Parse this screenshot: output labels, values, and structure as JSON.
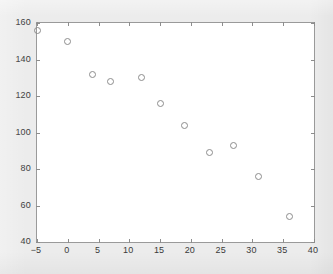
{
  "chart_data": {
    "type": "scatter",
    "title": "",
    "xlabel": "",
    "ylabel": "",
    "xlim": [
      -5,
      40
    ],
    "ylim": [
      40,
      160
    ],
    "xticks": [
      -5,
      0,
      5,
      10,
      15,
      20,
      25,
      30,
      35,
      40
    ],
    "yticks": [
      40,
      60,
      80,
      100,
      120,
      140,
      160
    ],
    "xticklabels": [
      "−5",
      "0",
      "5",
      "10",
      "15",
      "20",
      "25",
      "30",
      "35",
      "40"
    ],
    "yticklabels": [
      "40",
      "60",
      "80",
      "100",
      "120",
      "140",
      "160"
    ],
    "grid": false,
    "legend": null,
    "marker": {
      "shape": "circle-open",
      "edge_color": "#8d8d8d",
      "fill": "none",
      "size_px": 7
    },
    "series": [
      {
        "name": "series-1",
        "x": [
          -5,
          0,
          4,
          7,
          12,
          15,
          19,
          23,
          27,
          31,
          36
        ],
        "y": [
          156,
          150,
          132,
          128,
          130,
          116,
          104,
          89,
          93,
          76,
          54
        ],
        "points": [
          {
            "x": -5,
            "y": 156
          },
          {
            "x": 0,
            "y": 150
          },
          {
            "x": 4,
            "y": 132
          },
          {
            "x": 7,
            "y": 128
          },
          {
            "x": 12,
            "y": 130
          },
          {
            "x": 15,
            "y": 116
          },
          {
            "x": 19,
            "y": 104
          },
          {
            "x": 23,
            "y": 89
          },
          {
            "x": 27,
            "y": 93
          },
          {
            "x": 31,
            "y": 76
          },
          {
            "x": 36,
            "y": 54
          }
        ]
      }
    ]
  },
  "figure": {
    "background_color": "#ececec",
    "axes_background_color": "#ffffff",
    "axes_edge_color": "#9a9a9a"
  }
}
